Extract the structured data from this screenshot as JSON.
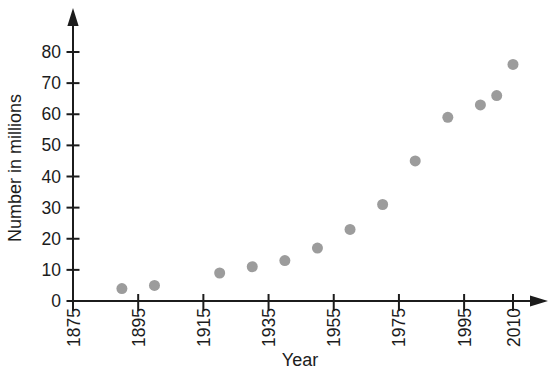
{
  "page": {
    "background": "#ffffff"
  },
  "chart_data": {
    "type": "scatter",
    "title": "",
    "xlabel": "Year",
    "ylabel": "Number in millions",
    "x_ticks": [
      1875,
      1895,
      1915,
      1935,
      1955,
      1975,
      1995,
      2010
    ],
    "y_ticks": [
      0,
      10,
      20,
      30,
      40,
      50,
      60,
      70,
      80
    ],
    "xlim": [
      1875,
      2010
    ],
    "ylim": [
      0,
      80
    ],
    "grid": false,
    "legend": false,
    "axis_arrows": true,
    "points": [
      {
        "year": 1890,
        "value": 4
      },
      {
        "year": 1900,
        "value": 5
      },
      {
        "year": 1920,
        "value": 9
      },
      {
        "year": 1930,
        "value": 11
      },
      {
        "year": 1940,
        "value": 13
      },
      {
        "year": 1950,
        "value": 17
      },
      {
        "year": 1960,
        "value": 23
      },
      {
        "year": 1970,
        "value": 31
      },
      {
        "year": 1980,
        "value": 45
      },
      {
        "year": 1990,
        "value": 59
      },
      {
        "year": 2000,
        "value": 63
      },
      {
        "year": 2005,
        "value": 66
      },
      {
        "year": 2010,
        "value": 76
      }
    ],
    "colors": {
      "dot": "#9c9c9c",
      "axis": "#1c1c1c",
      "text": "#1c1c1c"
    }
  }
}
